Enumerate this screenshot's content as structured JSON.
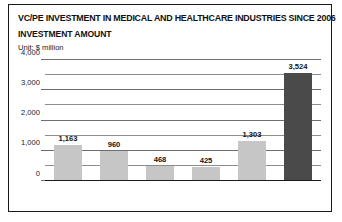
{
  "card": {
    "title": "VC/PE INVESTMENT IN MEDICAL AND HEALTHCARE INDUSTRIES SINCE 2006",
    "subtitle": "INVESTMENT AMOUNT",
    "unit": "Unit: $ million"
  },
  "colors": {
    "bar_light": "#c6c6c6",
    "bar_dark": "#4a4a4a",
    "border": "#1a1a1a",
    "gridline": "#6f6f6f",
    "background": "#ffffff",
    "text": "#141414"
  },
  "chart_data": {
    "type": "bar",
    "title": "VC/PE INVESTMENT IN MEDICAL AND HEALTHCARE INDUSTRIES SINCE 2006",
    "subtitle": "INVESTMENT AMOUNT",
    "xlabel": "",
    "ylabel": "Unit: $ million",
    "categories": [
      "2006",
      "2007",
      "2008",
      "2009",
      "2010",
      "2011, 1-9"
    ],
    "values": [
      1163,
      960,
      468,
      425,
      1303,
      3524
    ],
    "value_labels": [
      "1,163",
      "960",
      "468",
      "425",
      "1,303",
      "3,524"
    ],
    "bar_colors": [
      "#c6c6c6",
      "#c6c6c6",
      "#c6c6c6",
      "#c6c6c6",
      "#c6c6c6",
      "#4a4a4a"
    ],
    "ylim": [
      0,
      4000
    ],
    "yticks": [
      0,
      1000,
      2000,
      3000,
      4000
    ],
    "ytick_labels": [
      "0",
      "1,000",
      "2,000",
      "3,000",
      "4,000"
    ],
    "minor_yticks": [
      500,
      1500,
      2500,
      3500
    ],
    "grid": true,
    "legend": "none"
  }
}
